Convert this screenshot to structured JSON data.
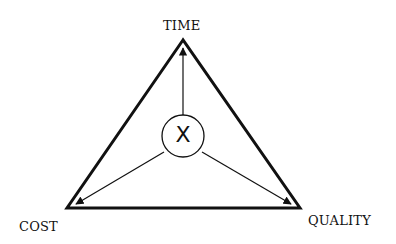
{
  "diagram": {
    "type": "project-management-triangle",
    "labels": {
      "top": "TIME",
      "bottom_left": "COST",
      "bottom_right": "QUALITY"
    },
    "center_label": "X",
    "colors": {
      "stroke": "#111111",
      "background": "#ffffff"
    },
    "arrows": [
      {
        "from": "center",
        "to": "TIME"
      },
      {
        "from": "center",
        "to": "COST"
      },
      {
        "from": "center",
        "to": "QUALITY"
      }
    ]
  }
}
